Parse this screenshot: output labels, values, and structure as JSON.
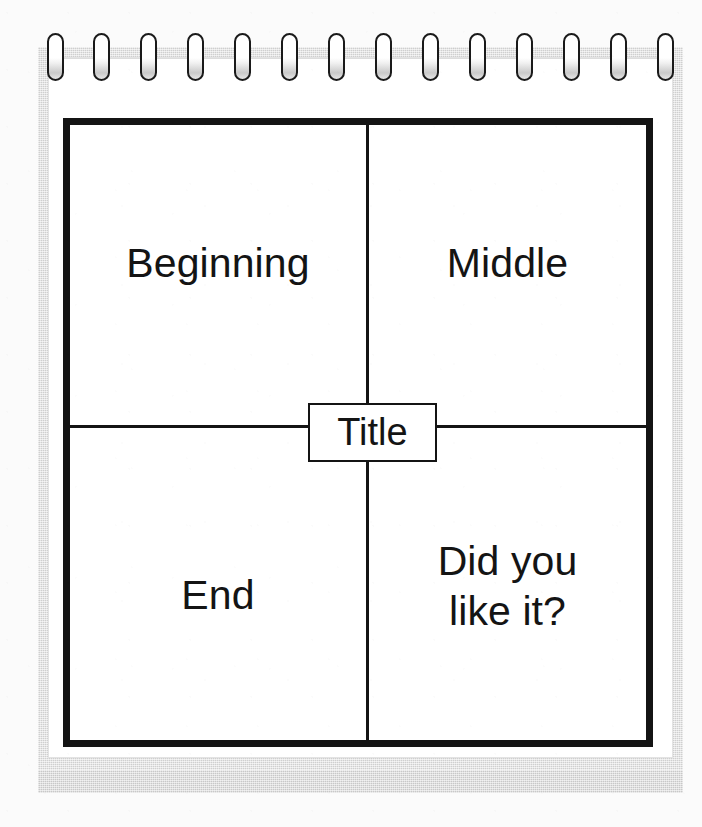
{
  "page": {
    "background_color": "#fbfbfb",
    "sheet_color": "#ffffff",
    "backing_color": "#d7d7d7",
    "ink_color": "#141414"
  },
  "binding": {
    "icon": "spiral-ring-icon",
    "ring_count": 14,
    "ring_color": "#1a1a1a"
  },
  "story_map": {
    "center_label": "Title",
    "quadrants": [
      {
        "key": "beginning",
        "label": "Beginning",
        "position": "top-left"
      },
      {
        "key": "middle",
        "label": "Middle",
        "position": "top-right"
      },
      {
        "key": "end",
        "label": "End",
        "position": "bottom-left"
      },
      {
        "key": "question",
        "label": "Did you\nlike it?",
        "position": "bottom-right"
      }
    ]
  }
}
